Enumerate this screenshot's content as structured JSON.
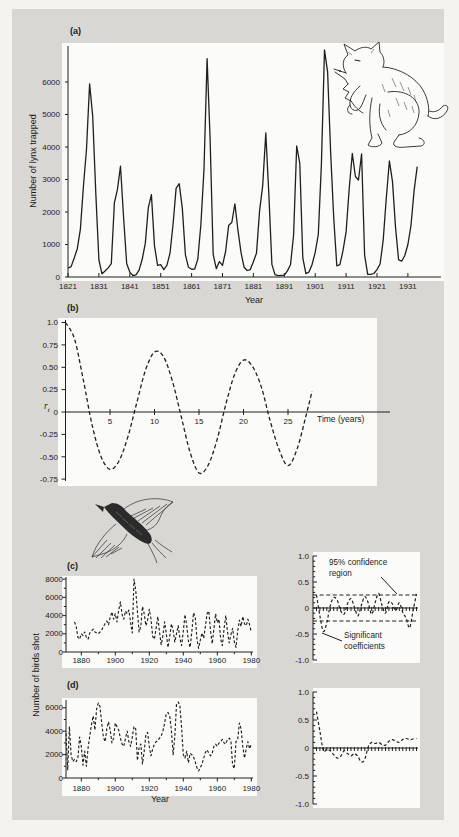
{
  "figure": {
    "rt_base": "r",
    "rt_sub": "t",
    "colors": {
      "page": "#f4f3ef",
      "panel_gray": "#d8d7d3",
      "plot_white": "#fbfbf9",
      "ink": "#1f1f1f"
    },
    "illustrations": [
      "lynx line drawing (sitting, raised forepaw)",
      "flying grouse line drawing"
    ]
  },
  "chart_data": [
    {
      "id": "a",
      "type": "line",
      "title": "(a)",
      "ylabel": "Number of lynx trapped",
      "xlabel": "Year",
      "style": "solid",
      "x_start": 1821,
      "x_step": 1,
      "xlim": [
        1821,
        1934
      ],
      "ylim": [
        0,
        7000
      ],
      "yticks": {
        "values": [
          0,
          1000,
          2000,
          3000,
          4000,
          5000,
          6000
        ],
        "labels": [
          "0",
          "1000",
          "2000",
          "3000",
          "4000",
          "5000",
          "6000"
        ]
      },
      "xticks": {
        "values": [
          1821,
          1831,
          1841,
          1851,
          1861,
          1871,
          1881,
          1891,
          1901,
          1911,
          1921,
          1931
        ],
        "labels": [
          "1821",
          "1831",
          "1841",
          "1851",
          "1861",
          "1871",
          "1881",
          "1891",
          "1901",
          "1911",
          "1921",
          "1931"
        ]
      },
      "values": [
        269,
        321,
        585,
        871,
        1475,
        2821,
        3928,
        5943,
        4950,
        2577,
        523,
        98,
        184,
        279,
        409,
        2285,
        2685,
        3409,
        1824,
        409,
        151,
        45,
        68,
        213,
        546,
        1033,
        2129,
        2536,
        957,
        361,
        377,
        225,
        360,
        731,
        1638,
        2725,
        2871,
        2119,
        684,
        299,
        236,
        245,
        552,
        1623,
        3311,
        6721,
        4254,
        687,
        255,
        473,
        358,
        784,
        1594,
        1676,
        2251,
        1426,
        756,
        299,
        201,
        229,
        469,
        736,
        2042,
        2811,
        4431,
        2511,
        389,
        73,
        39,
        49,
        59,
        188,
        377,
        1292,
        4031,
        3495,
        587,
        105,
        153,
        387,
        758,
        1307,
        3465,
        6991,
        6313,
        3794,
        1836,
        345,
        382,
        808,
        1388,
        2713,
        3800,
        3091,
        2985,
        3790,
        674,
        81,
        80,
        108,
        229,
        399,
        1132,
        2432,
        3574,
        2935,
        1537,
        529,
        485,
        662,
        1000,
        1590,
        2657,
        3396
      ]
    },
    {
      "id": "b",
      "type": "line",
      "title": "(b)",
      "ylabel": "rt",
      "xlabel": "Time (years)",
      "style": "dashed",
      "smooth": true,
      "xlim": [
        0,
        27.7
      ],
      "ylim": [
        -0.75,
        1.0
      ],
      "yticks": {
        "values": [
          1.0,
          0.75,
          0.5,
          0.25,
          0,
          -0.25,
          -0.5,
          -0.75
        ],
        "labels": [
          "1.0",
          "0.75",
          "0.50",
          "0.25",
          "0",
          "-0.25",
          "-0.50",
          "-0.75"
        ]
      },
      "xticks": {
        "values": [
          5,
          10,
          15,
          20,
          25
        ],
        "labels": [
          "5",
          "10",
          "15",
          "20",
          "25"
        ]
      },
      "x": [
        0,
        1,
        2,
        3,
        4,
        5,
        6,
        7,
        8,
        9,
        10,
        11,
        12,
        13,
        14,
        15,
        16,
        17,
        18,
        19,
        20,
        21,
        22,
        23,
        24,
        25,
        26,
        27,
        27.7
      ],
      "y": [
        1.0,
        0.82,
        0.36,
        -0.15,
        -0.5,
        -0.64,
        -0.55,
        -0.28,
        0.1,
        0.47,
        0.67,
        0.62,
        0.35,
        -0.05,
        -0.45,
        -0.68,
        -0.6,
        -0.32,
        0.08,
        0.42,
        0.58,
        0.51,
        0.28,
        -0.1,
        -0.42,
        -0.6,
        -0.42,
        -0.05,
        0.23
      ]
    },
    {
      "id": "c",
      "type": "line",
      "title": "(c)",
      "ylabel": "Number of birds shot",
      "xlabel": "",
      "style": "dashed",
      "x_start": 1876,
      "x_step": 1,
      "xlim": [
        1876,
        1980
      ],
      "ylim": [
        0,
        8000
      ],
      "yticks": {
        "values": [
          0,
          2000,
          4000,
          6000,
          8000
        ],
        "labels": [
          "0",
          "2000",
          "4000",
          "6000",
          "8000"
        ]
      },
      "minor_yticks": [
        1000,
        3000,
        5000,
        7000
      ],
      "xticks": {
        "values": [
          1880,
          1900,
          1920,
          1940,
          1960,
          1980
        ],
        "labels": [
          "1880",
          "1900",
          "1920",
          "1940",
          "1960",
          "1980"
        ]
      },
      "minor_xticks": [
        1890,
        1910,
        1930,
        1950,
        1970
      ],
      "values": [
        3300,
        2800,
        1600,
        1400,
        2000,
        1800,
        2200,
        1600,
        1400,
        2100,
        2300,
        2500,
        2200,
        2100,
        2000,
        2200,
        2400,
        2800,
        3100,
        3400,
        3000,
        3800,
        4400,
        3600,
        4200,
        3300,
        4600,
        5500,
        4100,
        3600,
        4500,
        4200,
        4600,
        3200,
        2100,
        8000,
        6800,
        4500,
        2200,
        2800,
        5000,
        4200,
        2900,
        3500,
        4700,
        3600,
        1700,
        1400,
        2600,
        3900,
        2200,
        800,
        1800,
        3300,
        2000,
        500,
        1700,
        3100,
        2400,
        1100,
        2000,
        2900,
        1500,
        700,
        2300,
        4100,
        2900,
        1200,
        500,
        2200,
        4300,
        3900,
        1500,
        400,
        1300,
        2100,
        1500,
        2800,
        4200,
        4500,
        2400,
        900,
        2500,
        4200,
        3200,
        3600,
        1400,
        700,
        2600,
        4000,
        2200,
        1000,
        1900,
        2600,
        1100,
        500,
        2300,
        3500,
        2800,
        3900,
        3100,
        2900,
        3600,
        3000,
        2200
      ]
    },
    {
      "id": "d",
      "type": "line",
      "title": "(d)",
      "ylabel": "Number of birds shot",
      "xlabel": "Year",
      "style": "dashed",
      "x_start": 1871,
      "x_step": 1,
      "xlim": [
        1871,
        1980
      ],
      "ylim": [
        0,
        6500
      ],
      "yticks": {
        "values": [
          0,
          2000,
          4000,
          6000
        ],
        "labels": [
          "0",
          "2000",
          "4000",
          "6000"
        ]
      },
      "minor_yticks": [
        1000,
        3000,
        5000
      ],
      "xticks": {
        "values": [
          1880,
          1900,
          1920,
          1940,
          1960,
          1980
        ],
        "labels": [
          "1880",
          "1900",
          "1920",
          "1940",
          "1960",
          "1980"
        ]
      },
      "minor_xticks": [
        1890,
        1910,
        1930,
        1950,
        1970
      ],
      "values": [
        3800,
        700,
        4400,
        2000,
        1400,
        1600,
        1400,
        1700,
        3500,
        2700,
        1100,
        2300,
        1000,
        2600,
        3600,
        4600,
        5300,
        4100,
        5900,
        6400,
        6100,
        4700,
        3500,
        3100,
        4200,
        4800,
        4100,
        3000,
        3400,
        4700,
        4400,
        4100,
        3400,
        2900,
        2700,
        3400,
        4000,
        3100,
        2700,
        3500,
        4400,
        4200,
        1500,
        2600,
        2900,
        1200,
        2300,
        3700,
        3900,
        2700,
        1900,
        2500,
        2900,
        3100,
        3200,
        3400,
        3600,
        4000,
        4700,
        5500,
        5600,
        5300,
        4100,
        2000,
        3500,
        6300,
        6500,
        6200,
        4300,
        2000,
        1700,
        2300,
        1300,
        2100,
        2000,
        1800,
        1400,
        900,
        600,
        900,
        1200,
        1700,
        2200,
        2400,
        2100,
        1900,
        2100,
        2700,
        2900,
        2700,
        3000,
        3100,
        3300,
        3000,
        2900,
        3300,
        3400,
        3200,
        1100,
        800,
        3100,
        3300,
        4700,
        4200,
        2700,
        1700,
        2500,
        3100,
        2500,
        2900
      ]
    },
    {
      "id": "e",
      "type": "line",
      "title": "correlogram of (c)",
      "style": "dashed",
      "smooth": true,
      "x_start": 1,
      "x_step": 1,
      "xlim": [
        0,
        30
      ],
      "ylim": [
        -1.0,
        1.0
      ],
      "confidence_band": 0.25,
      "lag_ticks": 30,
      "annotations": [
        "95% confidence\nregion",
        "Significant\ncoefficients"
      ],
      "yticks": {
        "values": [
          1,
          0.5,
          0,
          -0.5,
          -1
        ],
        "labels": [
          "1.0",
          "0.5",
          "0",
          "-0.5",
          "-1.0"
        ]
      },
      "minor_yticks": [
        -0.9,
        -0.8,
        -0.7,
        -0.6,
        -0.4,
        -0.3,
        -0.2,
        -0.1,
        0.1,
        0.2,
        0.3,
        0.4,
        0.6,
        0.7,
        0.8,
        0.9
      ],
      "values": [
        0.25,
        -0.15,
        -0.45,
        -0.28,
        0.05,
        0.2,
        0.15,
        -0.05,
        -0.12,
        0.08,
        0.18,
        0.02,
        -0.15,
        0.05,
        0.22,
        0.1,
        -0.12,
        0.1,
        0.28,
        0.05,
        -0.1,
        0.12,
        0.08,
        -0.05,
        0.1,
        -0.08,
        -0.2,
        -0.38,
        -0.05,
        0.27
      ]
    },
    {
      "id": "f",
      "type": "line",
      "title": "correlogram of (d)",
      "style": "dashed",
      "smooth": true,
      "x_start": 1,
      "x_step": 1,
      "xlim": [
        0,
        30
      ],
      "ylim": [
        -1.0,
        1.0
      ],
      "lag_ticks": 30,
      "yticks": {
        "values": [
          1,
          0.5,
          0,
          -0.5,
          -1
        ],
        "labels": [
          "1.0",
          "0.5",
          "0",
          "-0.5",
          "-1.0"
        ]
      },
      "minor_yticks": [
        -0.9,
        -0.8,
        -0.7,
        -0.6,
        -0.4,
        -0.3,
        -0.2,
        -0.1,
        0.1,
        0.2,
        0.3,
        0.4,
        0.6,
        0.7,
        0.8,
        0.9
      ],
      "values": [
        0.65,
        0.3,
        -0.05,
        -0.02,
        -0.05,
        -0.12,
        -0.18,
        -0.15,
        -0.05,
        -0.1,
        -0.14,
        -0.1,
        -0.15,
        -0.25,
        -0.2,
        0.02,
        0.1,
        0.08,
        0.1,
        0.06,
        0.05,
        0.12,
        0.15,
        0.12,
        0.1,
        0.15,
        0.17,
        0.15,
        0.16,
        0.17
      ]
    }
  ]
}
